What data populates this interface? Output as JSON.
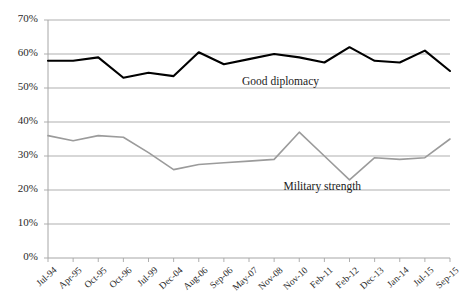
{
  "chart_data": {
    "type": "line",
    "title": "",
    "xlabel": "",
    "ylabel": "",
    "ylim": [
      0,
      0.7
    ],
    "grid": true,
    "legend_position": "inline-annotation",
    "categories": [
      "Jul-94",
      "Apr-95",
      "Oct-95",
      "Oct-96",
      "Jul-99",
      "Dec-04",
      "Aug-06",
      "Sep-06",
      "May-07",
      "Nov-08",
      "Nov-10",
      "Feb-11",
      "Feb-12",
      "Dec-13",
      "Jan-14",
      "Jul-15",
      "Sep-15"
    ],
    "ytick_labels": [
      "0%",
      "10%",
      "20%",
      "30%",
      "40%",
      "50%",
      "60%",
      "70%"
    ],
    "ytick_values": [
      0,
      10,
      20,
      30,
      40,
      50,
      60,
      70
    ],
    "series": [
      {
        "name": "Good diplomacy",
        "color": "#000000",
        "values": [
          58,
          58,
          59,
          53,
          54.5,
          53.5,
          60.5,
          57,
          58.5,
          60,
          59,
          57.5,
          62,
          58,
          57.5,
          61,
          55
        ]
      },
      {
        "name": "Military strength",
        "color": "#9b9b9b",
        "values": [
          36,
          34.5,
          36,
          35.5,
          31,
          26,
          27.5,
          28,
          28.5,
          29,
          37,
          30,
          23,
          29.5,
          29,
          29.5,
          35
        ]
      }
    ],
    "annotations": [
      {
        "name": "good-diplomacy-label",
        "text": "Good diplomacy",
        "x_pct": 52.5,
        "y_pct": 24.7
      },
      {
        "name": "military-strength-label",
        "text": "Military strength",
        "x_pct": 61.5,
        "y_pct": 59.5
      }
    ]
  }
}
